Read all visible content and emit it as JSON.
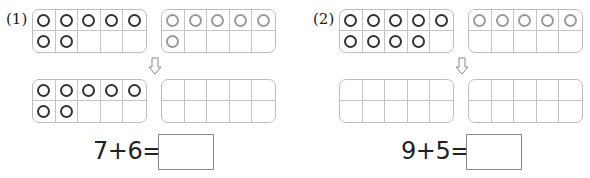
{
  "problems": [
    {
      "label": "(1)",
      "first_addend": 7,
      "second_addend": 6,
      "equation": "7+6=",
      "answer": "",
      "top_frames": {
        "left": {
          "filled": 7,
          "color": "dark"
        },
        "right": {
          "filled": 6,
          "color": "light"
        }
      },
      "bottom_frames": {
        "left": {
          "filled": 7,
          "color": "dark"
        },
        "right": {
          "filled": 0,
          "color": "light"
        }
      }
    },
    {
      "label": "(2)",
      "first_addend": 9,
      "second_addend": 5,
      "equation": "9+5=",
      "answer": "",
      "top_frames": {
        "left": {
          "filled": 9,
          "color": "dark"
        },
        "right": {
          "filled": 5,
          "color": "light"
        }
      },
      "bottom_frames": {
        "left": {
          "filled": 0,
          "color": "dark"
        },
        "right": {
          "filled": 0,
          "color": "light"
        }
      }
    }
  ],
  "icons": {
    "arrow": "down-arrow-outline"
  },
  "colors": {
    "dark_counter": "#333333",
    "light_counter": "#9a9a9a",
    "frame_border": "#bdbdbd"
  }
}
